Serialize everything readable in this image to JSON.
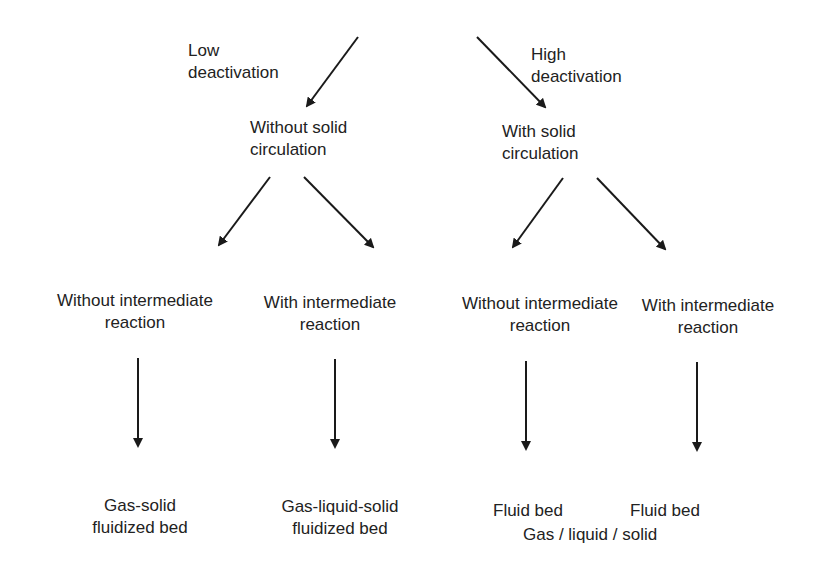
{
  "diagram": {
    "type": "decision-tree",
    "nodes": {
      "low_deactivation": {
        "line1": "Low",
        "line2": "deactivation"
      },
      "high_deactivation": {
        "line1": "High",
        "line2": "deactivation"
      },
      "without_solid_circulation": {
        "line1": "Without solid",
        "line2": "circulation"
      },
      "with_solid_circulation": {
        "line1": "With solid",
        "line2": "circulation"
      },
      "a_without_intermediate": {
        "line1": "Without intermediate",
        "line2": "reaction"
      },
      "a_with_intermediate": {
        "line1": "With intermediate",
        "line2": "reaction"
      },
      "b_without_intermediate": {
        "line1": "Without intermediate",
        "line2": "reaction"
      },
      "b_with_intermediate": {
        "line1": "With intermediate",
        "line2": "reaction"
      },
      "gas_solid": {
        "line1": "Gas-solid",
        "line2": "fluidized bed"
      },
      "gas_liquid_solid": {
        "line1": "Gas-liquid-solid",
        "line2": "fluidized bed"
      },
      "fluid_bed_1": {
        "line1": "Fluid bed"
      },
      "fluid_bed_2": {
        "line1": "Fluid bed"
      },
      "fluid_bed_shared": {
        "line1": "Gas / liquid / solid"
      }
    },
    "edges": [
      {
        "from": "low_deactivation",
        "to": "without_solid_circulation"
      },
      {
        "from": "high_deactivation",
        "to": "with_solid_circulation"
      },
      {
        "from": "without_solid_circulation",
        "to": "a_without_intermediate"
      },
      {
        "from": "without_solid_circulation",
        "to": "a_with_intermediate"
      },
      {
        "from": "with_solid_circulation",
        "to": "b_without_intermediate"
      },
      {
        "from": "with_solid_circulation",
        "to": "b_with_intermediate"
      },
      {
        "from": "a_without_intermediate",
        "to": "gas_solid"
      },
      {
        "from": "a_with_intermediate",
        "to": "gas_liquid_solid"
      },
      {
        "from": "b_without_intermediate",
        "to": "fluid_bed_1"
      },
      {
        "from": "b_with_intermediate",
        "to": "fluid_bed_2"
      }
    ],
    "colors": {
      "ink": "#222222",
      "background": "#ffffff"
    }
  }
}
